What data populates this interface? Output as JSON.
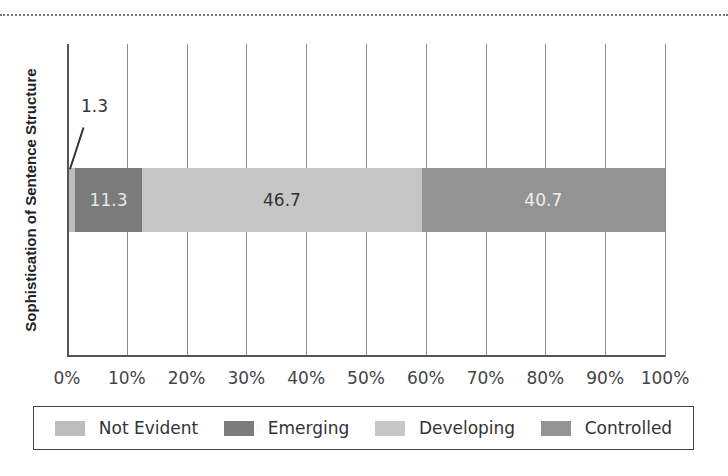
{
  "chart_data": {
    "type": "bar",
    "orientation": "horizontal",
    "stacked": true,
    "title": "",
    "xlabel": "",
    "ylabel": "Sophistication of Sentence Structure",
    "xlim": [
      0,
      100
    ],
    "x_ticks": [
      "0%",
      "10%",
      "20%",
      "30%",
      "40%",
      "50%",
      "60%",
      "70%",
      "80%",
      "90%",
      "100%"
    ],
    "grid": true,
    "legend_position": "bottom",
    "categories": [
      "Sophistication of Sentence Structure"
    ],
    "series": [
      {
        "name": "Not Evident",
        "values": [
          1.3
        ],
        "color": "#bdbdbd",
        "label": "1.3",
        "label_position": "callout"
      },
      {
        "name": "Emerging",
        "values": [
          11.3
        ],
        "color": "#7b7b7b",
        "label": "11.3",
        "label_color": "#e8e8e8"
      },
      {
        "name": "Developing",
        "values": [
          46.7
        ],
        "color": "#c6c6c6",
        "label": "46.7",
        "label_color": "#333333"
      },
      {
        "name": "Controlled",
        "values": [
          40.7
        ],
        "color": "#939393",
        "label": "40.7",
        "label_color": "#eeeeee"
      }
    ]
  }
}
